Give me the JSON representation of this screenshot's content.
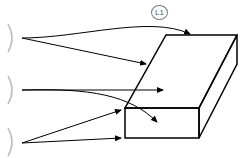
{
  "diagram": {
    "type": "isometric-block-with-arrows",
    "label": "L1",
    "colors": {
      "stroke": "#000000",
      "bracket": "#bbbbbb",
      "label": "#555555"
    },
    "brackets": [
      {
        "id": "bracket-top"
      },
      {
        "id": "bracket-middle"
      },
      {
        "id": "bracket-bottom"
      }
    ]
  }
}
